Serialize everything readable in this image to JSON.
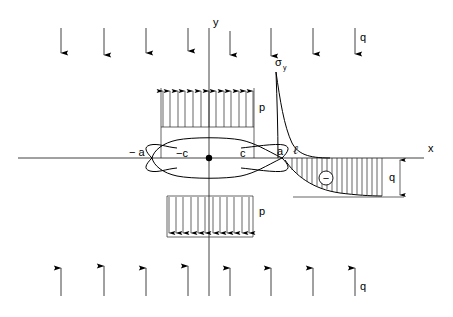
{
  "figure": {
    "background_color": "#ffffff",
    "line_color": "#000000",
    "width": 453,
    "height": 317
  },
  "axes": {
    "x_label": "x",
    "y_label": "y",
    "origin": {
      "x": 209,
      "y": 158
    },
    "x_axis": {
      "x1": 18,
      "y1": 158,
      "x2": 424,
      "y2": 158
    },
    "y_axis": {
      "x1": 209,
      "y1": 28,
      "x2": 209,
      "y2": 296
    },
    "x_label_pos": {
      "x": 428,
      "y": 152
    },
    "y_label_pos": {
      "x": 213,
      "y": 26
    },
    "origin_dot_radius": 3.2
  },
  "crack": {
    "half_length_outer_label_left": "− a",
    "half_length_inner_label_left": "−c",
    "half_length_inner_label_right": "c",
    "tip_label_right": "a",
    "cohesive_label": "ℓ",
    "a_left_x": 152,
    "a_right_x": 282,
    "c_left_x": 177,
    "c_right_x": 241,
    "max_half_height": 15,
    "labels": {
      "minus_a": {
        "text": "− a",
        "x": 129,
        "y": 156
      },
      "minus_c": {
        "text": "−c",
        "x": 176,
        "y": 157
      },
      "plus_c": {
        "text": "c",
        "x": 240,
        "y": 157
      },
      "a_tip": {
        "text": "a",
        "x": 277,
        "y": 155
      },
      "ell": {
        "text": "ℓ",
        "x": 294,
        "y": 154
      }
    }
  },
  "stress_curve": {
    "symbol": "σ",
    "subscript": "y",
    "label_pos": {
      "x": 276,
      "y": 66
    },
    "peak_x": 278,
    "peak_y": 72,
    "description": "Singular tensile stress peak at crack tip decaying to remote value"
  },
  "pressure_blocks": {
    "label": "p",
    "top": {
      "label": "p",
      "label_pos": {
        "x": 259,
        "y": 111
      },
      "left": 161,
      "right": 254,
      "top": 88,
      "bottom": 127,
      "arrow_count": 13,
      "direction": "up"
    },
    "bottom": {
      "label": "p",
      "label_pos": {
        "x": 259,
        "y": 215
      },
      "left": 167,
      "right": 253,
      "top": 196,
      "bottom": 237,
      "arrow_count": 12,
      "direction": "down"
    }
  },
  "remote_load": {
    "label": "q",
    "top": {
      "label": "q",
      "label_pos": {
        "x": 360,
        "y": 41
      },
      "direction": "down",
      "y_start": 28,
      "y_end": 56,
      "arrow_x": [
        61,
        104,
        146,
        188,
        230,
        271,
        313,
        355
      ]
    },
    "bottom": {
      "label": "q",
      "label_pos": {
        "x": 360,
        "y": 290
      },
      "direction": "up",
      "y_start": 296,
      "y_end": 266,
      "arrow_x": [
        61,
        104,
        146,
        188,
        230,
        271,
        313,
        355
      ]
    }
  },
  "compression_zone": {
    "sign_symbol": "−",
    "sign_circle_pos": {
      "x": 326,
      "y": 178
    },
    "sign_circle_radius": 7,
    "hatch_left": 290,
    "hatch_right": 382,
    "baseline_y": 197,
    "dimension": {
      "label": "q",
      "label_pos": {
        "x": 391,
        "y": 181
      },
      "x": 400,
      "y_top": 159,
      "y_bottom": 197
    },
    "base_line": {
      "x1": 293,
      "y1": 197,
      "x2": 404,
      "y2": 197
    }
  }
}
